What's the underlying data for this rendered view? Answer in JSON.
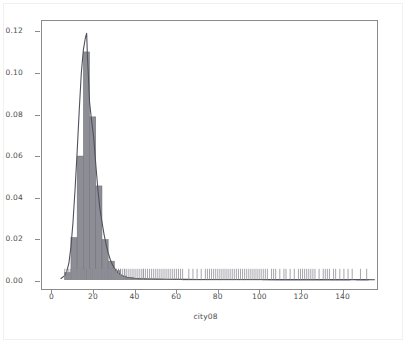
{
  "figure": {
    "background_color": "#ffffff",
    "frame_color": "#8a8a8a",
    "outer_border_color": "#f0f0f0",
    "tick_label_color": "#4d4d4d"
  },
  "chart_data": {
    "type": "bar",
    "subtype": "histogram-with-kde-and-rug",
    "title": "",
    "subtitle": "",
    "xlabel": "city08",
    "ylabel": "",
    "xlim": [
      -5,
      157
    ],
    "ylim": [
      -0.0045,
      0.1255
    ],
    "grid": false,
    "legend": null,
    "annotations": [],
    "hist_color": "#8d8d96",
    "hist_edge_color": "#6d6d77",
    "kde_color": "#50505a",
    "rug_color": "#8d8d96",
    "xticks": [
      0,
      20,
      40,
      60,
      80,
      100,
      120,
      140
    ],
    "xtick_labels": [
      "0",
      "20",
      "40",
      "60",
      "80",
      "100",
      "120",
      "140"
    ],
    "yticks": [
      0.0,
      0.02,
      0.04,
      0.06,
      0.08,
      0.1,
      0.12
    ],
    "ytick_labels": [
      "0.00",
      "0.02",
      "0.04",
      "0.06",
      "0.08",
      "0.10",
      "0.12"
    ],
    "bin_width": 3.0,
    "bins": [
      {
        "x0": 6,
        "x1": 9,
        "density": 0.0035
      },
      {
        "x0": 9,
        "x1": 12,
        "density": 0.0205
      },
      {
        "x0": 12,
        "x1": 15,
        "density": 0.06
      },
      {
        "x0": 15,
        "x1": 18,
        "density": 0.1105
      },
      {
        "x0": 18,
        "x1": 21,
        "density": 0.079
      },
      {
        "x0": 21,
        "x1": 24,
        "density": 0.0455
      },
      {
        "x0": 24,
        "x1": 27,
        "density": 0.0195
      },
      {
        "x0": 27,
        "x1": 30,
        "density": 0.009
      },
      {
        "x0": 30,
        "x1": 33,
        "density": 0.0045
      },
      {
        "x0": 33,
        "x1": 36,
        "density": 0.0018
      },
      {
        "x0": 36,
        "x1": 39,
        "density": 0.001
      },
      {
        "x0": 39,
        "x1": 42,
        "density": 0.0007
      },
      {
        "x0": 42,
        "x1": 45,
        "density": 0.0005
      },
      {
        "x0": 45,
        "x1": 48,
        "density": 0.0004
      },
      {
        "x0": 48,
        "x1": 51,
        "density": 0.0003
      },
      {
        "x0": 51,
        "x1": 54,
        "density": 0.0003
      },
      {
        "x0": 54,
        "x1": 57,
        "density": 0.0002
      },
      {
        "x0": 57,
        "x1": 60,
        "density": 0.0002
      },
      {
        "x0": 60,
        "x1": 63,
        "density": 0.0002
      },
      {
        "x0": 63,
        "x1": 66,
        "density": 0.0001
      },
      {
        "x0": 66,
        "x1": 69,
        "density": 0.0001
      },
      {
        "x0": 69,
        "x1": 72,
        "density": 0.0001
      },
      {
        "x0": 72,
        "x1": 75,
        "density": 0.0001
      },
      {
        "x0": 75,
        "x1": 78,
        "density": 0.0001
      },
      {
        "x0": 78,
        "x1": 81,
        "density": 0.0001
      },
      {
        "x0": 81,
        "x1": 84,
        "density": 0.0001
      },
      {
        "x0": 84,
        "x1": 87,
        "density": 0.0001
      },
      {
        "x0": 87,
        "x1": 90,
        "density": 0.0001
      },
      {
        "x0": 90,
        "x1": 93,
        "density": 0.0001
      },
      {
        "x0": 93,
        "x1": 96,
        "density": 0.0001
      },
      {
        "x0": 96,
        "x1": 99,
        "density": 0.0001
      },
      {
        "x0": 99,
        "x1": 102,
        "density": 0.0001
      },
      {
        "x0": 102,
        "x1": 105,
        "density": 5e-05
      },
      {
        "x0": 105,
        "x1": 108,
        "density": 5e-05
      },
      {
        "x0": 108,
        "x1": 111,
        "density": 5e-05
      },
      {
        "x0": 111,
        "x1": 114,
        "density": 5e-05
      },
      {
        "x0": 114,
        "x1": 117,
        "density": 5e-05
      },
      {
        "x0": 117,
        "x1": 120,
        "density": 5e-05
      },
      {
        "x0": 120,
        "x1": 123,
        "density": 5e-05
      },
      {
        "x0": 123,
        "x1": 126,
        "density": 5e-05
      },
      {
        "x0": 126,
        "x1": 129,
        "density": 5e-05
      },
      {
        "x0": 129,
        "x1": 132,
        "density": 5e-05
      },
      {
        "x0": 132,
        "x1": 135,
        "density": 5e-05
      },
      {
        "x0": 135,
        "x1": 138,
        "density": 3e-05
      },
      {
        "x0": 138,
        "x1": 141,
        "density": 3e-05
      },
      {
        "x0": 141,
        "x1": 144,
        "density": 3e-05
      },
      {
        "x0": 147,
        "x1": 150,
        "density": 3e-05
      },
      {
        "x0": 150,
        "x1": 153,
        "density": 2e-05
      }
    ],
    "kde": {
      "x": [
        4,
        6,
        7,
        8,
        9,
        10,
        11,
        12,
        13,
        14,
        15,
        16,
        16.6,
        17,
        17.4,
        18,
        19,
        20,
        21,
        22,
        23,
        24,
        25,
        26,
        27,
        28,
        29,
        30,
        31,
        32,
        33,
        34,
        35,
        36,
        38,
        40,
        42,
        44,
        46,
        48,
        50,
        55,
        60,
        65,
        70,
        80,
        90,
        100,
        110,
        120,
        130,
        140,
        150,
        156
      ],
      "y": [
        0.0005,
        0.002,
        0.004,
        0.008,
        0.016,
        0.028,
        0.044,
        0.062,
        0.082,
        0.1,
        0.1115,
        0.1175,
        0.1195,
        0.1075,
        0.0995,
        0.086,
        0.077,
        0.069,
        0.056,
        0.044,
        0.0345,
        0.028,
        0.022,
        0.0172,
        0.013,
        0.0098,
        0.0074,
        0.0056,
        0.0042,
        0.0032,
        0.0025,
        0.0019,
        0.0015,
        0.0012,
        0.0009,
        0.0007,
        0.00055,
        0.00045,
        0.00038,
        0.00032,
        0.00028,
        0.00022,
        0.00018,
        0.00016,
        0.00014,
        0.00011,
        9e-05,
        8e-05,
        7e-05,
        6e-05,
        5e-05,
        4e-05,
        3e-05,
        2e-05
      ]
    },
    "rug_values": [
      6,
      7,
      8,
      9,
      9,
      10,
      10,
      10,
      11,
      11,
      11,
      11,
      12,
      12,
      12,
      12,
      12,
      13,
      13,
      13,
      13,
      13,
      13,
      14,
      14,
      14,
      14,
      14,
      14,
      14,
      15,
      15,
      15,
      15,
      15,
      15,
      15,
      15,
      16,
      16,
      16,
      16,
      16,
      16,
      16,
      16,
      16,
      17,
      17,
      17,
      17,
      17,
      17,
      17,
      17,
      17,
      18,
      18,
      18,
      18,
      18,
      18,
      18,
      18,
      19,
      19,
      19,
      19,
      19,
      19,
      19,
      20,
      20,
      20,
      20,
      20,
      20,
      21,
      21,
      21,
      21,
      21,
      22,
      22,
      22,
      22,
      22,
      23,
      23,
      23,
      23,
      24,
      24,
      24,
      24,
      25,
      25,
      25,
      26,
      26,
      26,
      27,
      27,
      27,
      28,
      28,
      29,
      29,
      30,
      30,
      31,
      31,
      32,
      32,
      33,
      33,
      34,
      35,
      35,
      36,
      37,
      38,
      39,
      40,
      41,
      42,
      43,
      44,
      44,
      45,
      46,
      47,
      48,
      49,
      50,
      51,
      52,
      53,
      54,
      55,
      56,
      57,
      58,
      59,
      60,
      61,
      62,
      63,
      66,
      68,
      70,
      72,
      74,
      75,
      76,
      77,
      78,
      79,
      80,
      81,
      82,
      83,
      84,
      85,
      86,
      87,
      88,
      89,
      90,
      91,
      92,
      93,
      94,
      95,
      96,
      97,
      98,
      99,
      100,
      101,
      102,
      103,
      104,
      106,
      107,
      108,
      110,
      112,
      113,
      115,
      117,
      119,
      120,
      121,
      122,
      123,
      124,
      125,
      126,
      127,
      129,
      131,
      132,
      133,
      134,
      136,
      137,
      139,
      141,
      143,
      145,
      149,
      152
    ]
  }
}
